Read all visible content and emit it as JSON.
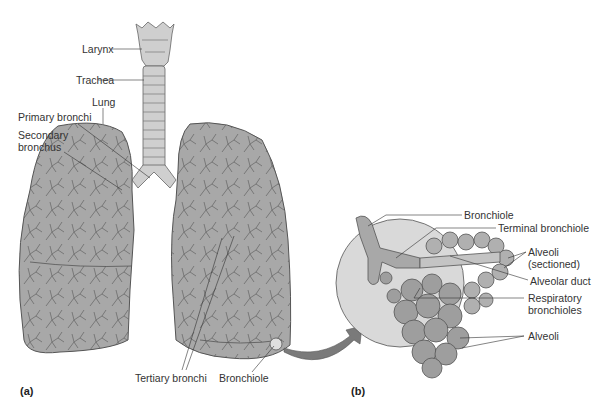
{
  "figure": {
    "panel_a_label": "(a)",
    "panel_b_label": "(b)",
    "colors": {
      "lung_fill": "#a8a8a8",
      "airway_fill": "#cfcfcf",
      "outline": "#555555",
      "circle_fill": "#d9d9d9",
      "alveoli_fill": "#9e9e9e",
      "arrow_fill": "#7a7a7a",
      "label_color": "#333333"
    }
  },
  "panel_a": {
    "labels": {
      "larynx": "Larynx",
      "trachea": "Trachea",
      "lung": "Lung",
      "primary_bronchi": "Primary bronchi",
      "secondary_bronchus_1": "Secondary",
      "secondary_bronchus_2": "bronchus",
      "tertiary_bronchi": "Tertiary bronchi",
      "bronchiole": "Bronchiole"
    }
  },
  "panel_b": {
    "labels": {
      "bronchiole": "Bronchiole",
      "terminal_bronchiole": "Terminal bronchiole",
      "alveoli_sectioned_1": "Alveoli",
      "alveoli_sectioned_2": "(sectioned)",
      "alveolar_duct": "Alveolar duct",
      "respiratory_bronchioles_1": "Respiratory",
      "respiratory_bronchioles_2": "bronchioles",
      "alveoli": "Alveoli"
    }
  }
}
